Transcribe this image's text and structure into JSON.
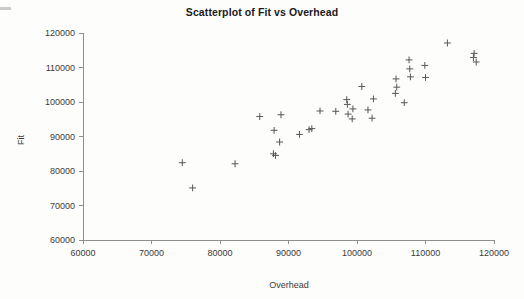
{
  "chart_data": {
    "type": "scatter",
    "title": "Scatterplot of Fit vs Overhead",
    "xlabel": "Overhead",
    "ylabel": "Fit",
    "xlim": [
      60000,
      120000
    ],
    "ylim": [
      60000,
      120000
    ],
    "xticks": [
      60000,
      70000,
      80000,
      90000,
      100000,
      110000,
      120000
    ],
    "yticks": [
      60000,
      70000,
      80000,
      90000,
      100000,
      110000,
      120000
    ],
    "xtick_labels": [
      "60000",
      "70000",
      "80000",
      "90000",
      "100000",
      "110000",
      "120000"
    ],
    "ytick_labels": [
      "60000",
      "70000",
      "80000",
      "90000",
      "100000",
      "110000",
      "120000"
    ],
    "grid": false,
    "legend": false,
    "marker": "plus",
    "marker_color": "#5d5d5d",
    "series": [
      {
        "name": "Fit vs Overhead",
        "points": [
          [
            74500,
            82400
          ],
          [
            76000,
            75100
          ],
          [
            82200,
            82100
          ],
          [
            85800,
            95800
          ],
          [
            87900,
            91800
          ],
          [
            87800,
            85000
          ],
          [
            88100,
            84500
          ],
          [
            88900,
            96300
          ],
          [
            88700,
            88400
          ],
          [
            91600,
            90600
          ],
          [
            93000,
            92000
          ],
          [
            93400,
            92300
          ],
          [
            94600,
            97400
          ],
          [
            96900,
            97300
          ],
          [
            98500,
            100700
          ],
          [
            98600,
            99300
          ],
          [
            98700,
            96500
          ],
          [
            99400,
            98000
          ],
          [
            99300,
            95100
          ],
          [
            100700,
            104500
          ],
          [
            101600,
            97700
          ],
          [
            102400,
            100900
          ],
          [
            102200,
            95300
          ],
          [
            105700,
            106700
          ],
          [
            105800,
            104300
          ],
          [
            105600,
            102500
          ],
          [
            106900,
            99800
          ],
          [
            107600,
            112200
          ],
          [
            107700,
            109600
          ],
          [
            107800,
            107300
          ],
          [
            109900,
            110600
          ],
          [
            110000,
            107100
          ],
          [
            113200,
            117100
          ],
          [
            117100,
            114100
          ],
          [
            117000,
            112900
          ],
          [
            117400,
            111600
          ]
        ]
      }
    ]
  },
  "axes": {
    "plot_left_px": 83,
    "plot_right_px": 494,
    "plot_top_px": 33,
    "plot_bottom_px": 240
  }
}
